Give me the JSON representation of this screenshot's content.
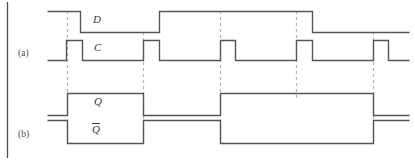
{
  "figure": {
    "kind": "digital-timing-diagram",
    "width": 415,
    "height": 160,
    "colors": {
      "waveform": "#555555",
      "dashed_guide": "#b4b4b4",
      "frame_rule": "#4d4d4d",
      "label_text": "#3a3a3a",
      "group_text": "#4a4a4a",
      "background": "#ffffff"
    }
  },
  "labels": {
    "signal_d": "D",
    "signal_c": "C",
    "signal_q": "Q",
    "signal_qbar": "Q",
    "group_a": "(a)",
    "group_b": "(b)"
  },
  "chart_data": {
    "type": "line",
    "title": "",
    "xlabel": "",
    "ylabel": "",
    "grid": false,
    "legend_position": "left-axis-labels",
    "xlim": [
      40,
      415
    ],
    "style": {
      "stroke": "#555555",
      "stroke_width": 1.4,
      "guide_stroke": "#b4b4b4",
      "guide_dash": "3,3"
    },
    "clock_edges": [
      66,
      143,
      220,
      296,
      373
    ],
    "guides": [
      {
        "x": 67,
        "y_top": 11,
        "y_bottom": 143
      },
      {
        "x": 143,
        "y_top": 32,
        "y_bottom": 143
      },
      {
        "x": 220,
        "y_top": 11,
        "y_bottom": 143
      },
      {
        "x": 296,
        "y_top": 11,
        "y_bottom": 100
      },
      {
        "x": 373,
        "y_top": 32,
        "y_bottom": 143
      }
    ],
    "series": [
      {
        "name": "D",
        "level_high_y": 11,
        "level_low_y": 32,
        "initial_state": 1,
        "points": [
          [
            47,
            1
          ],
          [
            80,
            1
          ],
          [
            80,
            0
          ],
          [
            159,
            0
          ],
          [
            159,
            1
          ],
          [
            312,
            1
          ],
          [
            312,
            0
          ],
          [
            409,
            0
          ]
        ]
      },
      {
        "name": "C",
        "level_high_y": 40,
        "level_low_y": 60,
        "initial_state": 0,
        "pulse_width": 16,
        "points": [
          [
            47,
            0
          ],
          [
            66,
            0
          ],
          [
            66,
            1
          ],
          [
            82,
            1
          ],
          [
            82,
            0
          ],
          [
            143,
            0
          ],
          [
            143,
            1
          ],
          [
            159,
            1
          ],
          [
            159,
            0
          ],
          [
            220,
            0
          ],
          [
            220,
            1
          ],
          [
            235,
            1
          ],
          [
            235,
            0
          ],
          [
            296,
            0
          ],
          [
            296,
            1
          ],
          [
            312,
            1
          ],
          [
            312,
            0
          ],
          [
            373,
            0
          ],
          [
            373,
            1
          ],
          [
            388,
            1
          ],
          [
            388,
            0
          ],
          [
            409,
            0
          ]
        ]
      },
      {
        "name": "Q",
        "level_high_y": 93,
        "level_low_y": 115,
        "initial_state": 0,
        "points": [
          [
            47,
            0
          ],
          [
            67,
            0
          ],
          [
            67,
            1
          ],
          [
            143,
            1
          ],
          [
            143,
            0
          ],
          [
            220,
            0
          ],
          [
            220,
            1
          ],
          [
            373,
            1
          ],
          [
            373,
            0
          ],
          [
            409,
            0
          ]
        ]
      },
      {
        "name": "Qbar",
        "level_high_y": 120,
        "level_low_y": 143,
        "initial_state": 1,
        "points": [
          [
            47,
            1
          ],
          [
            67,
            1
          ],
          [
            67,
            0
          ],
          [
            143,
            0
          ],
          [
            143,
            1
          ],
          [
            220,
            1
          ],
          [
            220,
            0
          ],
          [
            373,
            0
          ],
          [
            373,
            1
          ],
          [
            409,
            1
          ]
        ]
      }
    ]
  }
}
